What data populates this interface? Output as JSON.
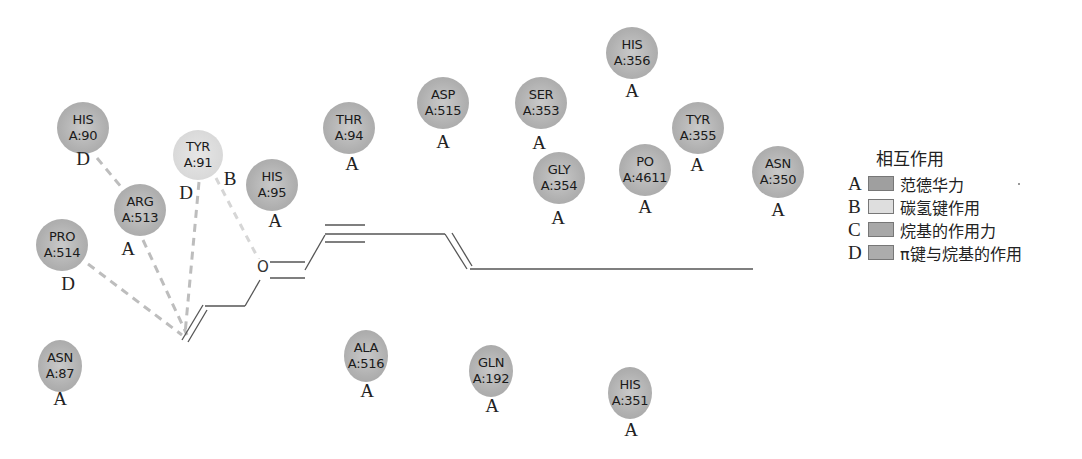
{
  "diagram": {
    "type": "2D ligand-residue interaction diagram",
    "ligand": {
      "atom_labels": [
        "O"
      ]
    },
    "residues": [
      {
        "name": "HIS",
        "id": "A:90",
        "type": "D",
        "x": 83,
        "y": 128,
        "r": 26,
        "shade": "dark",
        "halo": false
      },
      {
        "name": "ARG",
        "id": "A:513",
        "type": "A",
        "x": 140,
        "y": 210,
        "r": 26,
        "shade": "dark",
        "halo": false
      },
      {
        "name": "PRO",
        "id": "A:514",
        "type": "D",
        "x": 62,
        "y": 245,
        "r": 26,
        "shade": "dark",
        "halo": true
      },
      {
        "name": "TYR",
        "id": "A:91",
        "type": "D",
        "x": 198,
        "y": 155,
        "r": 25,
        "shade": "light",
        "halo": false
      },
      {
        "name": "HIS",
        "id": "A:95",
        "type": "A",
        "x": 272,
        "y": 185,
        "r": 26,
        "shade": "dark",
        "halo": false
      },
      {
        "name": "THR",
        "id": "A:94",
        "type": "A",
        "x": 349,
        "y": 128,
        "r": 26,
        "shade": "dark",
        "halo": false
      },
      {
        "name": "ASP",
        "id": "A:515",
        "type": "A",
        "x": 443,
        "y": 103,
        "r": 26,
        "shade": "dark",
        "halo": false
      },
      {
        "name": "SER",
        "id": "A:353",
        "type": "A",
        "x": 541,
        "y": 103,
        "r": 26,
        "shade": "dark",
        "halo": false
      },
      {
        "name": "GLY",
        "id": "A:354",
        "type": "A",
        "x": 559,
        "y": 178,
        "r": 26,
        "shade": "dark",
        "halo": false
      },
      {
        "name": "HIS",
        "id": "A:356",
        "type": "A",
        "x": 632,
        "y": 53,
        "r": 26,
        "shade": "dark",
        "halo": false
      },
      {
        "name": "PO",
        "id": "A:4611",
        "type": "A",
        "x": 645,
        "y": 170,
        "r": 26,
        "shade": "dark",
        "halo": false
      },
      {
        "name": "TYR",
        "id": "A:355",
        "type": "A",
        "x": 698,
        "y": 128,
        "r": 26,
        "shade": "dark",
        "halo": false
      },
      {
        "name": "ASN",
        "id": "A:350",
        "type": "A",
        "x": 778,
        "y": 172,
        "r": 26,
        "shade": "dark",
        "halo": false
      },
      {
        "name": "ASN",
        "id": "A:87",
        "type": "A",
        "x": 60,
        "y": 362,
        "r": 22,
        "shade": "dark",
        "halo": false
      },
      {
        "name": "ALA",
        "id": "A:516",
        "type": "A",
        "x": 366,
        "y": 352,
        "r": 22,
        "shade": "dark",
        "halo": false
      },
      {
        "name": "GLN",
        "id": "A:192",
        "type": "A",
        "x": 491,
        "y": 367,
        "r": 22,
        "shade": "dark",
        "halo": false
      },
      {
        "name": "HIS",
        "id": "A:351",
        "type": "A",
        "x": 630,
        "y": 389,
        "r": 22,
        "shade": "dark",
        "halo": false
      }
    ],
    "type_letters": [
      {
        "text": "D",
        "x": 83,
        "y": 150
      },
      {
        "text": "A",
        "x": 128,
        "y": 240
      },
      {
        "text": "D",
        "x": 68,
        "y": 275
      },
      {
        "text": "D",
        "x": 186,
        "y": 184
      },
      {
        "text": "B",
        "x": 230,
        "y": 170
      },
      {
        "text": "A",
        "x": 275,
        "y": 212
      },
      {
        "text": "A",
        "x": 352,
        "y": 155
      },
      {
        "text": "A",
        "x": 443,
        "y": 133
      },
      {
        "text": "A",
        "x": 539,
        "y": 134
      },
      {
        "text": "A",
        "x": 558,
        "y": 209
      },
      {
        "text": "A",
        "x": 632,
        "y": 82
      },
      {
        "text": "A",
        "x": 645,
        "y": 198
      },
      {
        "text": "A",
        "x": 697,
        "y": 156
      },
      {
        "text": "A",
        "x": 778,
        "y": 201
      },
      {
        "text": "A",
        "x": 60,
        "y": 390
      },
      {
        "text": "A",
        "x": 367,
        "y": 382
      },
      {
        "text": "A",
        "x": 492,
        "y": 397
      },
      {
        "text": "A",
        "x": 631,
        "y": 421
      }
    ],
    "interactions": [
      {
        "from": "HIS A:90",
        "type": "D",
        "color": "#bdbdbd"
      },
      {
        "from": "ARG A:513",
        "type": "A",
        "color": "#bdbdbd"
      },
      {
        "from": "PRO A:514",
        "type": "D",
        "color": "#bdbdbd"
      },
      {
        "from": "TYR A:91",
        "type": "D",
        "color": "#bdbdbd"
      },
      {
        "from": "TYR A:91",
        "type": "B",
        "color": "#d4d4d4"
      }
    ]
  },
  "legend": {
    "title": "相互作用",
    "items": [
      {
        "letter": "A",
        "label": "范德华力",
        "color": "#9f9f9f"
      },
      {
        "letter": "B",
        "label": "碳氢键作用",
        "color": "#dedede"
      },
      {
        "letter": "C",
        "label": "烷基的作用力",
        "color": "#a8a8a8"
      },
      {
        "letter": "D",
        "label": "π键与烷基的作用",
        "color": "#acacac"
      }
    ]
  },
  "colors": {
    "bond": "#555555",
    "dashed_dark": "#b8b8b8",
    "dashed_light": "#d2d2d2"
  }
}
